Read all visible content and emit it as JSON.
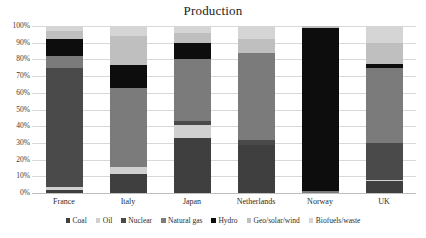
{
  "chart_data": {
    "type": "bar",
    "subtype": "stacked-percentage-column",
    "title": "Production",
    "xlabel": "",
    "ylabel": "",
    "ylim": [
      0,
      100
    ],
    "yunit": "%",
    "grid": true,
    "legend_position": "bottom",
    "categories": [
      "France",
      "Italy",
      "Japan",
      "Netherlands",
      "Norway",
      "UK"
    ],
    "ytick_labels": [
      "100%",
      "90%",
      "80%",
      "70%",
      "60%",
      "50%",
      "40%",
      "30%",
      "20%",
      "10%",
      "0%"
    ],
    "ytick_values": [
      100,
      90,
      80,
      70,
      60,
      50,
      40,
      30,
      20,
      10,
      0
    ],
    "series": [
      {
        "name": "Coal",
        "color": "#3f3f3f",
        "values": [
          2.0,
          11.5,
          33.0,
          29.0,
          0.0,
          7.0
        ]
      },
      {
        "name": "Oil",
        "color": "#d0d0d0",
        "values": [
          1.5,
          4.0,
          8.0,
          0.0,
          0.0,
          1.0
        ]
      },
      {
        "name": "Nuclear",
        "color": "#4a4a4a",
        "values": [
          71.5,
          0.0,
          2.0,
          3.0,
          0.0,
          22.0
        ]
      },
      {
        "name": "Natural gas",
        "color": "#7b7b7b",
        "values": [
          7.0,
          47.5,
          37.0,
          52.0,
          1.5,
          45.0
        ]
      },
      {
        "name": "Hydro",
        "color": "#0d0d0d",
        "values": [
          10.0,
          13.5,
          10.0,
          0.0,
          97.5,
          2.0
        ]
      },
      {
        "name": "Geo/solar/wind",
        "color": "#bfbfbf",
        "values": [
          5.0,
          17.5,
          6.0,
          8.0,
          1.0,
          13.0
        ]
      },
      {
        "name": "Biofuels/waste",
        "color": "#d5d5d5",
        "values": [
          3.0,
          6.0,
          4.0,
          8.0,
          0.0,
          10.0
        ]
      }
    ]
  }
}
